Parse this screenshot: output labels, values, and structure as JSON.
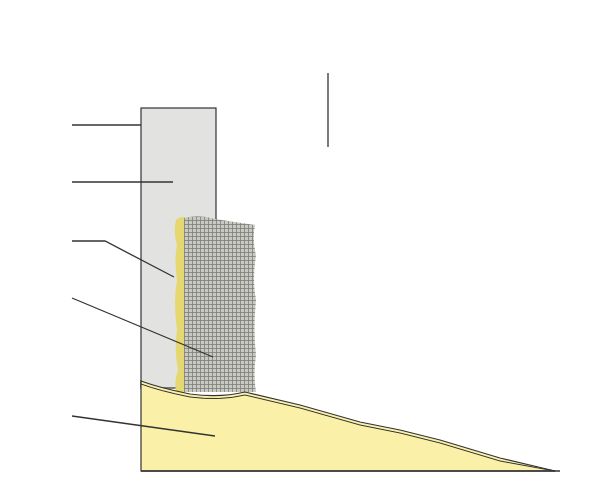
{
  "diagram": {
    "type": "cross-section",
    "colors": {
      "brick_line": "#8a8a8a",
      "render_fill": "#e2e2e0",
      "mesh_fill": "#b9b9b4",
      "adhesive_fill": "#e6d870",
      "soil_fill": "#faf0a8",
      "outline": "#333333"
    },
    "callouts": [
      {
        "id": "1",
        "label": "1",
        "cx": 328,
        "cy": 57
      },
      {
        "id": "5",
        "label": "5",
        "cx": 56,
        "cy": 125
      },
      {
        "id": "6",
        "label": "6",
        "cx": 56,
        "cy": 182
      },
      {
        "id": "2",
        "label": "2",
        "cx": 56,
        "cy": 241
      },
      {
        "id": "3",
        "label": "3",
        "cx": 56,
        "cy": 298
      },
      {
        "id": "4",
        "label": "4",
        "cx": 56,
        "cy": 416
      }
    ]
  }
}
